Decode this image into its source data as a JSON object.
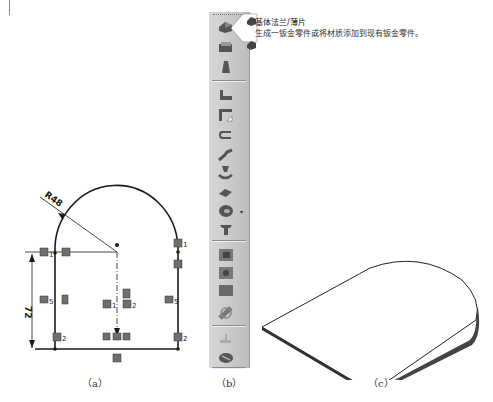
{
  "figure": {
    "panels": [
      {
        "id": "a",
        "caption": "（a）",
        "description": "2D sketch of base flange profile"
      },
      {
        "id": "b",
        "caption": "（b）",
        "description": "Sheet metal toolbar"
      },
      {
        "id": "c",
        "caption": "（c）",
        "description": "Resulting sheet metal part"
      }
    ]
  },
  "sketch": {
    "radius_label": "R48",
    "height_label": "72",
    "relation_labels": {
      "left_top": "1",
      "right_top": "1",
      "left_mid": "5",
      "right_mid": "5",
      "center_left": "1",
      "center_right": "2",
      "left_bottom": "2",
      "right_bottom": "2"
    },
    "colors": {
      "line": "#1a1a1a",
      "relation_icon": "#6a6a6a"
    }
  },
  "toolbar": {
    "items": [
      {
        "name": "base-flange-tab",
        "group": 1
      },
      {
        "name": "convert-to-sheet-metal",
        "group": 1
      },
      {
        "name": "lofted-bend",
        "group": 1
      },
      {
        "name": "edge-flange",
        "group": 2
      },
      {
        "name": "miter-flange",
        "group": 2
      },
      {
        "name": "hem",
        "group": 2
      },
      {
        "name": "jog",
        "group": 2
      },
      {
        "name": "sketched-bend",
        "group": 2
      },
      {
        "name": "cross-break",
        "group": 2
      },
      {
        "name": "closed-corner",
        "group": 2,
        "has_dropdown": true
      },
      {
        "name": "welded-corner",
        "group": 2
      },
      {
        "name": "break-corner",
        "group": 3
      },
      {
        "name": "corner-relief",
        "group": 3
      },
      {
        "name": "forming-tool",
        "group": 3
      },
      {
        "name": "unfold",
        "group": 4
      },
      {
        "name": "fold",
        "group": 4
      },
      {
        "name": "flatten",
        "group": 4
      },
      {
        "name": "no-bends",
        "group": 4
      },
      {
        "name": "insert-bends",
        "group": 5
      },
      {
        "name": "rip",
        "group": 5
      }
    ]
  },
  "tooltip": {
    "title": "基体法兰/薄片",
    "description": "生成一钣金零件或将材质添加到现有钣金零件。"
  }
}
